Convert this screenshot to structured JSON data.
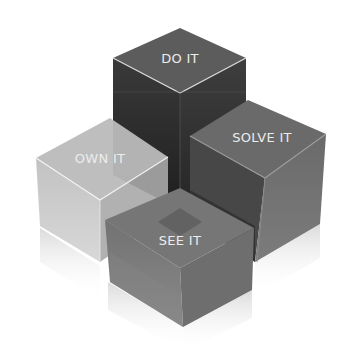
{
  "diagram": {
    "type": "3d-cube-cluster",
    "cubes": [
      {
        "id": "do",
        "label": "DO IT",
        "position": "back",
        "top_color": "#5a5a5a",
        "left_color": "#2a2a2a",
        "right_color": "#333333"
      },
      {
        "id": "own",
        "label": "OWN IT",
        "position": "left",
        "top_color": "#b9b9b9",
        "left_color": "#c4c4c4",
        "right_color": "#a8a8a8"
      },
      {
        "id": "solve",
        "label": "SOLVE IT",
        "position": "right",
        "top_color": "#6c6c6c",
        "left_color": "#4c4c4c",
        "right_color": "#707070"
      },
      {
        "id": "see",
        "label": "SEE IT",
        "position": "front",
        "top_color": "#7a7a7a",
        "left_color": "#727272",
        "right_color": "#6a6a6a"
      }
    ],
    "edge_highlight": "#e6e6e6",
    "background": "#ffffff"
  }
}
